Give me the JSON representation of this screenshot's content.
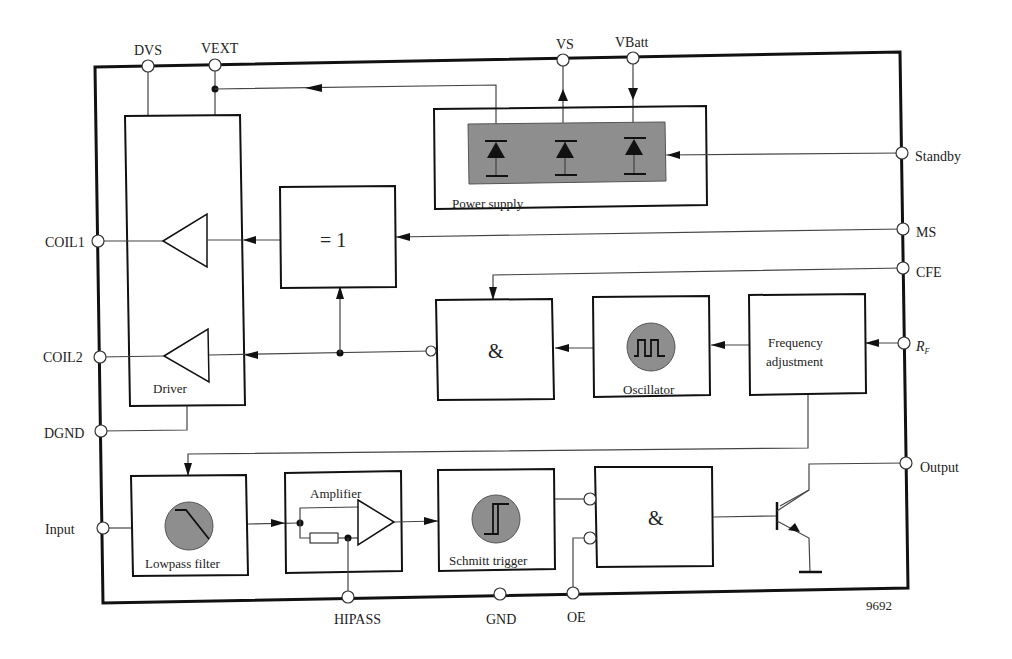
{
  "diagram": {
    "figure_number": "9692",
    "pins": {
      "dvs": "DVS",
      "vext": "VEXT",
      "vs": "VS",
      "vbatt": "VBatt",
      "standby": "Standby",
      "ms": "MS",
      "cfe": "CFE",
      "rf": "R",
      "rf_sub": "F",
      "coil1": "COIL1",
      "coil2": "COIL2",
      "dgnd": "DGND",
      "input": "Input",
      "hipass": "HIPASS",
      "gnd": "GND",
      "oe": "OE",
      "output": "Output"
    },
    "blocks": {
      "driver": "Driver",
      "power_supply": "Power supply",
      "xor": "= 1",
      "and_top": "&",
      "oscillator": "Oscillator",
      "frequency_adjustment_line1": "Frequency",
      "frequency_adjustment_line2": "adjustment",
      "lowpass_filter": "Lowpass filter",
      "amplifier": "Amplifier",
      "schmitt_trigger": "Schmitt trigger",
      "and_bottom": "&"
    },
    "colors": {
      "line": "#111111",
      "symbol_fill": "#8e8e8e",
      "background": "#ffffff"
    }
  }
}
